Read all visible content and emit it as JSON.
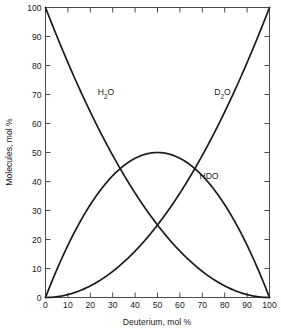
{
  "chart_data": {
    "type": "line",
    "title": "",
    "subtitle": "",
    "xlabel": "Deuterium, mol %",
    "ylabel": "Molecules, mol %",
    "xlim": [
      0,
      100
    ],
    "ylim": [
      0,
      100
    ],
    "xticks": [
      0,
      10,
      20,
      30,
      40,
      50,
      60,
      70,
      80,
      90,
      100
    ],
    "yticks": [
      0,
      10,
      20,
      30,
      40,
      50,
      60,
      70,
      80,
      90,
      100
    ],
    "xticklabels": [
      "0",
      "10",
      "20",
      "30",
      "40",
      "50",
      "60",
      "70",
      "80",
      "90",
      "100"
    ],
    "yticklabels": [
      "0",
      "10",
      "20",
      "30",
      "40",
      "50",
      "60",
      "70",
      "80",
      "90",
      "100"
    ],
    "grid": false,
    "legend_position": "inline-annotations",
    "x": [
      0,
      5,
      10,
      15,
      20,
      25,
      30,
      35,
      40,
      45,
      50,
      55,
      60,
      65,
      70,
      75,
      80,
      85,
      90,
      95,
      100
    ],
    "series": [
      {
        "name": "H2O",
        "label_text": "H",
        "label_sub": "2",
        "label_tail": "O",
        "label_x": 27,
        "label_y": 70,
        "formula": "(1-x)^2 * 100",
        "values": [
          100,
          90.25,
          81,
          72.25,
          64,
          56.25,
          49,
          42.25,
          36,
          30.25,
          25,
          20.25,
          16,
          12.25,
          9,
          6.25,
          4,
          2.25,
          1,
          0.25,
          0
        ]
      },
      {
        "name": "HDO",
        "label_text": "HDO",
        "label_sub": "",
        "label_tail": "",
        "label_x": 73,
        "label_y": 41,
        "formula": "2*x*(1-x) * 100",
        "values": [
          0,
          9.5,
          18,
          25.5,
          32,
          37.5,
          42,
          45.5,
          48,
          49.5,
          50,
          49.5,
          48,
          45.5,
          42,
          37.5,
          32,
          25.5,
          18,
          9.5,
          0
        ]
      },
      {
        "name": "D2O",
        "label_text": "D",
        "label_sub": "2",
        "label_tail": "O",
        "label_x": 79,
        "label_y": 70,
        "formula": "x^2 * 100",
        "values": [
          0,
          0.25,
          1,
          2.25,
          4,
          6.25,
          9,
          12.25,
          16,
          20.25,
          25,
          30.25,
          36,
          42.25,
          49,
          56.25,
          64,
          72.25,
          81,
          90.25,
          100
        ]
      }
    ],
    "annotations": [
      {
        "text": "HDO peak",
        "x": 50,
        "y": 48
      }
    ],
    "colors": {
      "curve": "#1a1a1a",
      "frame": "#4a4a4a",
      "background": "#ffffff"
    }
  }
}
